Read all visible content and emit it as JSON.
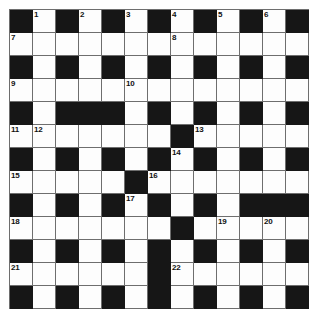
{
  "puzzle": {
    "title": "Crossword Grid",
    "type": "crossword",
    "rows": 13,
    "columns": 13,
    "cell_size_px": 23,
    "colors": {
      "block": "#161616",
      "open": "#fdfdfd",
      "grid_line": "#6e6e6e",
      "number": "#111111",
      "page_background": "#ffffff"
    },
    "legend": {
      "block_symbol": "#",
      "open_symbol": "."
    },
    "grid": [
      "#.#.#.#.#.#.#",
      ".............",
      "#.#.#.#.#.#.#",
      ".............",
      "#.###.#.#.#.#",
      ".......#.....",
      "#.#.#.#.#.#.#",
      ".....#.......",
      "#.#.#.#.#.###",
      ".......#.....",
      "#.#.#.#.#.#.#",
      "......#......",
      "#.#.#.#.#.#.#"
    ],
    "numbers": [
      {
        "label": "1",
        "row": 0,
        "col": 1
      },
      {
        "label": "2",
        "row": 0,
        "col": 3
      },
      {
        "label": "3",
        "row": 0,
        "col": 5
      },
      {
        "label": "4",
        "row": 0,
        "col": 7
      },
      {
        "label": "5",
        "row": 0,
        "col": 9
      },
      {
        "label": "6",
        "row": 0,
        "col": 11
      },
      {
        "label": "7",
        "row": 1,
        "col": 0
      },
      {
        "label": "8",
        "row": 1,
        "col": 7
      },
      {
        "label": "9",
        "row": 3,
        "col": 0
      },
      {
        "label": "10",
        "row": 3,
        "col": 5
      },
      {
        "label": "11",
        "row": 5,
        "col": 0
      },
      {
        "label": "12",
        "row": 5,
        "col": 1
      },
      {
        "label": "13",
        "row": 5,
        "col": 8
      },
      {
        "label": "14",
        "row": 6,
        "col": 7
      },
      {
        "label": "15",
        "row": 7,
        "col": 0
      },
      {
        "label": "16",
        "row": 7,
        "col": 6
      },
      {
        "label": "17",
        "row": 8,
        "col": 5
      },
      {
        "label": "18",
        "row": 9,
        "col": 0
      },
      {
        "label": "19",
        "row": 9,
        "col": 9
      },
      {
        "label": "20",
        "row": 9,
        "col": 11
      },
      {
        "label": "21",
        "row": 11,
        "col": 0
      },
      {
        "label": "22",
        "row": 11,
        "col": 7
      }
    ],
    "entries": []
  }
}
